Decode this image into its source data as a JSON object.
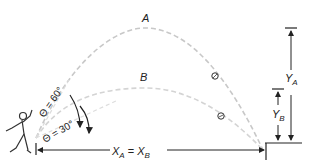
{
  "diagram": {
    "trajectories": [
      {
        "id": "A",
        "label": "A",
        "launch_angle": "Θ = 60°"
      },
      {
        "id": "B",
        "label": "B",
        "launch_angle": "Θ = 30°"
      }
    ],
    "labels": {
      "traj_a": "A",
      "traj_b": "B",
      "angle_a": "Θ = 60°",
      "angle_b": "Θ = 30°",
      "range": "X",
      "range_sub_a": "A",
      "range_eq": " = ",
      "range_b": "X",
      "range_sub_b": "B",
      "height_a": "Y",
      "height_a_sub": "A",
      "height_b": "Y",
      "height_b_sub": "B"
    },
    "colors": {
      "trajectory": "#c8c8c8",
      "lines": "#222222"
    }
  }
}
